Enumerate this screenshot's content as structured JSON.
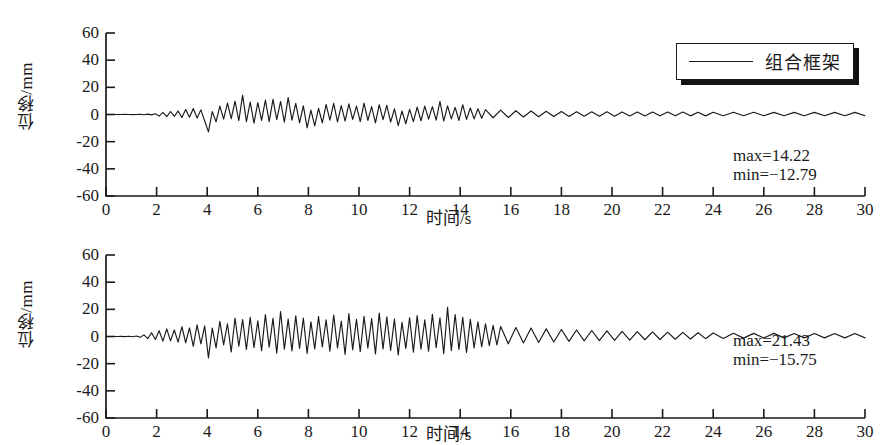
{
  "figure": {
    "background": "#ffffff",
    "line_color": "#1a1a1a",
    "axis_color": "#1a1a1a"
  },
  "chart_data": [
    {
      "type": "line",
      "panel": "top",
      "title": "",
      "xlabel": "时间/s",
      "ylabel": "位移/mm",
      "xlim": [
        0,
        30
      ],
      "ylim": [
        -60,
        60
      ],
      "xticks": [
        0,
        2,
        4,
        6,
        8,
        10,
        12,
        14,
        16,
        18,
        20,
        22,
        24,
        26,
        28,
        30
      ],
      "yticks": [
        -60,
        -40,
        -20,
        0,
        20,
        40,
        60
      ],
      "xtick_labels": [
        "0",
        "2",
        "4",
        "6",
        "8",
        "10",
        "12",
        "14",
        "16",
        "18",
        "20",
        "22",
        "24",
        "26",
        "28",
        "30"
      ],
      "ytick_labels": [
        "-60",
        "-40",
        "-20",
        "0",
        "20",
        "40",
        "60"
      ],
      "grid": false,
      "legend_position": "upper right",
      "series": [
        {
          "name": "组合框架",
          "color": "#1a1a1a",
          "max": 14.22,
          "min": -12.79,
          "x": [
            0,
            0.15,
            0.3,
            0.45,
            0.6,
            0.75,
            0.9,
            1.05,
            1.2,
            1.35,
            1.5,
            1.65,
            1.8,
            1.95,
            2.1,
            2.25,
            2.4,
            2.55,
            2.7,
            2.85,
            3,
            3.15,
            3.3,
            3.45,
            3.6,
            3.75,
            3.9,
            4.05,
            4.2,
            4.35,
            4.5,
            4.65,
            4.8,
            4.95,
            5.1,
            5.25,
            5.4,
            5.55,
            5.7,
            5.85,
            6,
            6.15,
            6.3,
            6.45,
            6.6,
            6.75,
            6.9,
            7.05,
            7.2,
            7.35,
            7.5,
            7.65,
            7.8,
            7.95,
            8.1,
            8.25,
            8.4,
            8.55,
            8.7,
            8.85,
            9,
            9.15,
            9.3,
            9.45,
            9.6,
            9.75,
            9.9,
            10.05,
            10.2,
            10.35,
            10.5,
            10.65,
            10.8,
            10.95,
            11.1,
            11.25,
            11.4,
            11.55,
            11.7,
            11.85,
            12,
            12.15,
            12.3,
            12.45,
            12.6,
            12.75,
            12.9,
            13.05,
            13.2,
            13.35,
            13.5,
            13.65,
            13.8,
            13.95,
            14.1,
            14.25,
            14.4,
            14.55,
            14.7,
            14.85,
            15,
            15.3,
            15.6,
            15.9,
            16.2,
            16.5,
            16.8,
            17.1,
            17.4,
            17.7,
            18,
            18.3,
            18.6,
            18.9,
            19.2,
            19.5,
            19.8,
            20.1,
            20.4,
            20.7,
            21,
            21.3,
            21.6,
            21.9,
            22.2,
            22.5,
            22.8,
            23.1,
            23.4,
            23.7,
            24,
            24.4,
            24.8,
            25.2,
            25.6,
            26,
            26.4,
            26.8,
            27.2,
            27.6,
            28,
            28.4,
            28.8,
            29.2,
            29.6,
            30
          ],
          "y": [
            0,
            0,
            0,
            0,
            0,
            0.1,
            0,
            -0.1,
            0,
            0.2,
            -0.2,
            0.3,
            -0.3,
            0.5,
            -1.2,
            1.5,
            -1.6,
            2.2,
            -1.4,
            2.6,
            -2.2,
            3.6,
            -2,
            4.4,
            -2.6,
            3.4,
            -4.8,
            -12.79,
            2.2,
            -5.4,
            6.2,
            -3.4,
            8.4,
            -3,
            9.8,
            -4.6,
            14.22,
            -5.2,
            9.2,
            -6.4,
            8.8,
            -4.4,
            10.6,
            -5.2,
            11.2,
            -3.8,
            9.6,
            -5.6,
            12.4,
            -4.2,
            8.2,
            -6.2,
            6.4,
            -9.8,
            3.2,
            -8.4,
            4.6,
            -6.2,
            7.4,
            -4.2,
            8.2,
            -5.4,
            6.6,
            -4.8,
            7.8,
            -3.6,
            6.2,
            -5.2,
            8.4,
            -4.4,
            5.8,
            -6.2,
            7.2,
            -3.8,
            6.8,
            -5.6,
            4.2,
            -8.2,
            2.6,
            -6.8,
            3.8,
            -5.2,
            5.4,
            -4.6,
            6.2,
            -3.4,
            5.8,
            -4.2,
            9.6,
            -4.8,
            6.4,
            -3.2,
            5.2,
            -4.4,
            7.2,
            -3.6,
            4.8,
            -3.2,
            4.2,
            -2.8,
            3.6,
            -2.4,
            3.2,
            -2.2,
            2.8,
            -1.8,
            2.6,
            -1.6,
            2.4,
            -1.5,
            2.2,
            -1.4,
            2.1,
            -1.3,
            2,
            -1.2,
            2,
            -1.2,
            1.9,
            -1.1,
            1.9,
            -1.1,
            1.8,
            -1,
            1.8,
            -1,
            1.8,
            -1,
            1.7,
            -1,
            1.7,
            -0.9,
            1.7,
            -0.9,
            1.7,
            -0.9,
            1.6,
            -0.9,
            1.6,
            -0.9,
            1.6,
            -0.9,
            1.6,
            -0.9,
            1.6,
            -0.9,
            1.6
          ]
        }
      ],
      "annotations": [
        {
          "text": "max=14.22",
          "value": 14.22
        },
        {
          "text": "min=−12.79",
          "value": -12.79
        }
      ]
    },
    {
      "type": "line",
      "panel": "bottom",
      "title": "",
      "xlabel": "时间/s",
      "ylabel": "位移/mm",
      "xlim": [
        0,
        30
      ],
      "ylim": [
        -60,
        60
      ],
      "xticks": [
        0,
        2,
        4,
        6,
        8,
        10,
        12,
        14,
        16,
        18,
        20,
        22,
        24,
        26,
        28,
        30
      ],
      "yticks": [
        -60,
        -40,
        -20,
        0,
        20,
        40,
        60
      ],
      "xtick_labels": [
        "0",
        "2",
        "4",
        "6",
        "8",
        "10",
        "12",
        "14",
        "16",
        "18",
        "20",
        "22",
        "24",
        "26",
        "28",
        "30"
      ],
      "ytick_labels": [
        "-60",
        "-40",
        "-20",
        "0",
        "20",
        "40",
        "60"
      ],
      "grid": false,
      "legend_position": "upper right",
      "series": [
        {
          "name": "钢框架",
          "color": "#1a1a1a",
          "max": 21.43,
          "min": -15.75,
          "x": [
            0,
            0.15,
            0.3,
            0.45,
            0.6,
            0.75,
            0.9,
            1.05,
            1.2,
            1.35,
            1.5,
            1.65,
            1.8,
            1.95,
            2.1,
            2.25,
            2.4,
            2.55,
            2.7,
            2.85,
            3,
            3.15,
            3.3,
            3.45,
            3.6,
            3.75,
            3.9,
            4.05,
            4.2,
            4.35,
            4.5,
            4.65,
            4.8,
            4.95,
            5.1,
            5.25,
            5.4,
            5.55,
            5.7,
            5.85,
            6,
            6.15,
            6.3,
            6.45,
            6.6,
            6.75,
            6.9,
            7.05,
            7.2,
            7.35,
            7.5,
            7.65,
            7.8,
            7.95,
            8.1,
            8.25,
            8.4,
            8.55,
            8.7,
            8.85,
            9,
            9.15,
            9.3,
            9.45,
            9.6,
            9.75,
            9.9,
            10.05,
            10.2,
            10.35,
            10.5,
            10.65,
            10.8,
            10.95,
            11.1,
            11.25,
            11.4,
            11.55,
            11.7,
            11.85,
            12,
            12.15,
            12.3,
            12.45,
            12.6,
            12.75,
            12.9,
            13.05,
            13.2,
            13.35,
            13.5,
            13.65,
            13.8,
            13.95,
            14.1,
            14.25,
            14.4,
            14.55,
            14.7,
            14.85,
            15,
            15.15,
            15.3,
            15.45,
            15.6,
            15.9,
            16.2,
            16.5,
            16.8,
            17.1,
            17.4,
            17.7,
            18,
            18.3,
            18.6,
            18.9,
            19.2,
            19.5,
            19.8,
            20.1,
            20.4,
            20.7,
            21,
            21.3,
            21.6,
            21.9,
            22.2,
            22.5,
            22.8,
            23.1,
            23.4,
            23.7,
            24,
            24.4,
            24.8,
            25.2,
            25.6,
            26,
            26.4,
            26.8,
            27.2,
            27.6,
            28,
            28.4,
            28.8,
            29.2,
            29.6,
            30
          ],
          "y": [
            0,
            0,
            0,
            0,
            0.1,
            -0.1,
            0.2,
            -0.2,
            0.4,
            -0.5,
            1.2,
            -1.6,
            2.8,
            -2.2,
            4.2,
            -3.4,
            5.6,
            -3.2,
            4.8,
            -4.2,
            7.2,
            -4.6,
            6.4,
            -7.2,
            8.6,
            -5.4,
            7.8,
            -15.75,
            6.2,
            -8.4,
            11.2,
            -6.2,
            9.4,
            -11.4,
            13.6,
            -7.2,
            12.4,
            -9.6,
            14.2,
            -8.2,
            11.6,
            -10.4,
            16.2,
            -7.8,
            13.4,
            -12.2,
            18.4,
            -9.4,
            12.8,
            -10.6,
            15.2,
            -8.8,
            13.6,
            -12.4,
            10.8,
            -9.2,
            14.6,
            -7.6,
            12.2,
            -10.8,
            15.8,
            -8.4,
            11.4,
            -13.2,
            16.8,
            -9.8,
            12.6,
            -11.2,
            14.8,
            -8.6,
            13.2,
            -12.8,
            17.2,
            -9.2,
            14.4,
            -10.2,
            12.8,
            -13.6,
            10.4,
            -8.8,
            13.8,
            -11.6,
            15.4,
            -9.4,
            12.2,
            -10.8,
            16.4,
            -8.2,
            13.8,
            -12.6,
            21.43,
            -10.4,
            16.2,
            -9.6,
            14.2,
            -11.8,
            12.6,
            -8.4,
            10.8,
            -7.6,
            9.4,
            -6.8,
            8.2,
            -6.2,
            7.4,
            -5.4,
            6.6,
            -4.8,
            6.2,
            -4.4,
            5.6,
            -4,
            5.2,
            -3.6,
            4.8,
            -3.2,
            4.4,
            -3,
            4.2,
            -2.8,
            3.8,
            -2.6,
            3.6,
            -2.4,
            3.4,
            -2.2,
            3.2,
            -2,
            3,
            -1.8,
            2.8,
            -1.6,
            2.6,
            -1.4,
            2.4,
            -1.2,
            2.3,
            -1.1,
            2.3,
            -1,
            2.2,
            -1,
            2.2,
            -1,
            2.2,
            -1,
            2.2,
            -1,
            2.2
          ]
        }
      ],
      "annotations": [
        {
          "text": "max=21.43",
          "value": 21.43
        },
        {
          "text": "min=−15.75",
          "value": -15.75
        }
      ]
    }
  ]
}
